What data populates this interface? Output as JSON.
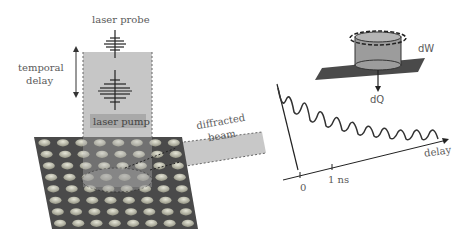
{
  "labels": {
    "laser_probe": "laser probe",
    "temporal_delay_line1": "temporal",
    "temporal_delay_line2": "delay",
    "laser_pump": "laser pump",
    "diffracted_line1": "diffracted",
    "diffracted_line2": "beam",
    "dW": "dW",
    "dQ": "dQ",
    "delay_axis": "delay",
    "tick_0": "0",
    "tick_1ns": "1 ns"
  },
  "sample": {
    "grid_rows": 8,
    "grid_cols": 8
  },
  "colors": {
    "plate": "#4a4a4a",
    "dots": "#b8b8a8",
    "beam": "#bdbdbd",
    "pump_label_bg": "#a8a8a8",
    "curve": "#333333",
    "cylinder": "#999999"
  }
}
